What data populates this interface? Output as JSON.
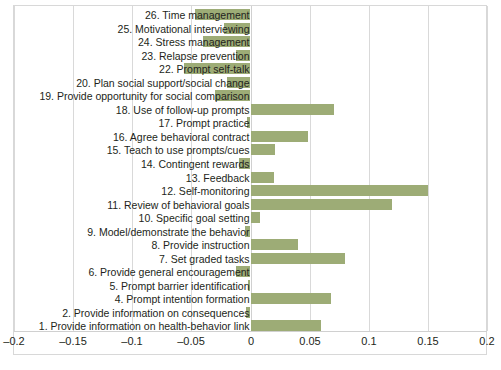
{
  "chart_data": {
    "type": "bar",
    "orientation": "horizontal",
    "title": "",
    "xlabel": "",
    "ylabel": "",
    "xlim": [
      -0.2,
      0.2
    ],
    "xticks": [
      "-0.2",
      "-0.15",
      "-0.1",
      "-0.05",
      "0",
      "0.05",
      "0.1",
      "0.15",
      "0.2"
    ],
    "xtick_values": [
      -0.2,
      -0.15,
      -0.1,
      -0.05,
      0,
      0.05,
      0.1,
      0.15,
      0.2
    ],
    "grid": true,
    "legend": "none",
    "bar_color": "#9dac76",
    "gridline_color": "#d9d9d9",
    "background_color": "#ffffff",
    "categories": [
      "1. Provide information on health-behavior link",
      "2. Provide information on consequences",
      "4. Prompt intention formation",
      "5. Prompt barrier identification",
      "6. Provide general encouragement",
      "7. Set graded tasks",
      "8. Provide instruction",
      "9. Model/demonstrate the behavior",
      "10. Specific goal setting",
      "11. Review of behavioral goals",
      "12. Self-monitoring",
      "13. Feedback",
      "14. Contingent rewards",
      "15. Teach to use prompts/cues",
      "16. Agree behavioral contract",
      "17. Prompt practice",
      "18. Use of follow-up prompts",
      "19. Provide opportunity for social comparison",
      "20. Plan social support/social change",
      "22. Prompt self-talk",
      "23. Relapse prevention",
      "24. Stress management",
      "25. Motivational interviewing",
      "26. Time management"
    ],
    "values": [
      0.06,
      -0.004,
      0.068,
      -0.002,
      -0.012,
      0.08,
      0.04,
      -0.005,
      0.008,
      0.12,
      0.15,
      0.02,
      -0.01,
      0.021,
      0.049,
      -0.003,
      0.071,
      -0.03,
      -0.02,
      -0.056,
      -0.012,
      -0.04,
      -0.022,
      -0.047
    ]
  }
}
